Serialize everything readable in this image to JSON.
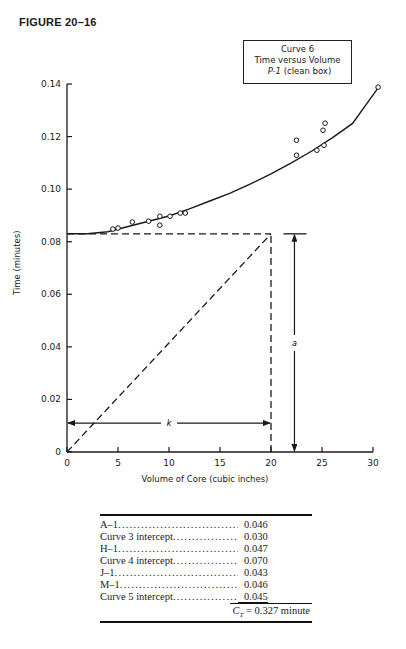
{
  "figure_label": "FIGURE 20–16",
  "legend": {
    "line1": "Curve 6",
    "line2": "Time versus Volume",
    "line3_italic": "P-1",
    "line3_rest": " (clean box)"
  },
  "annotations": {
    "k_label": "k",
    "a_label": "a"
  },
  "chart_data": {
    "type": "scatter",
    "xlabel": "Volume of Core (cubic inches)",
    "ylabel": "Time (minutes)",
    "xlim": [
      0,
      30
    ],
    "ylim": [
      0,
      0.14
    ],
    "xticks": [
      "0",
      "5",
      "10",
      "15",
      "20",
      "25",
      "30"
    ],
    "yticks": [
      "0",
      "0.02",
      "0.04",
      "0.06",
      "0.08",
      "0.10",
      "0.12",
      "0.14"
    ],
    "grid": false,
    "series": [
      {
        "name": "Observed points",
        "marker": "open-circle",
        "points": [
          [
            4.5,
            0.0848
          ],
          [
            5.0,
            0.0852
          ],
          [
            6.4,
            0.0875
          ],
          [
            8.0,
            0.0878
          ],
          [
            9.1,
            0.0897
          ],
          [
            9.1,
            0.0863
          ],
          [
            10.1,
            0.0897
          ],
          [
            11.1,
            0.0909
          ],
          [
            11.6,
            0.0909
          ],
          [
            22.5,
            0.1186
          ],
          [
            22.5,
            0.1129
          ],
          [
            24.5,
            0.1148
          ],
          [
            25.2,
            0.1167
          ],
          [
            25.1,
            0.1224
          ],
          [
            25.3,
            0.1251
          ],
          [
            30.5,
            0.1388
          ]
        ]
      },
      {
        "name": "Fitted curve",
        "style": "solid-line",
        "points": [
          [
            0,
            0.083
          ],
          [
            2,
            0.083
          ],
          [
            4,
            0.0838
          ],
          [
            6,
            0.0858
          ],
          [
            8,
            0.0878
          ],
          [
            10,
            0.0898
          ],
          [
            12,
            0.0925
          ],
          [
            14,
            0.0955
          ],
          [
            16,
            0.0985
          ],
          [
            18,
            0.102
          ],
          [
            20,
            0.1058
          ],
          [
            22,
            0.11
          ],
          [
            24,
            0.1145
          ],
          [
            26,
            0.1195
          ],
          [
            28,
            0.125
          ],
          [
            30.5,
            0.1385
          ]
        ]
      }
    ],
    "construction_lines": {
      "intercept_horizontal_dashed": {
        "y": 0.083,
        "x_from": 0,
        "x_to": 20
      },
      "vertical_dashed": {
        "x": 20,
        "y_from": 0,
        "y_to": 0.083
      },
      "diagonal_dashed": {
        "from": [
          0,
          0
        ],
        "to": [
          20,
          0.083
        ]
      },
      "k_dimension": {
        "y": 0.011,
        "x_from": 0,
        "x_to": 20,
        "label": "k"
      },
      "a_dimension": {
        "x": 22.3,
        "y_from": 0,
        "y_to": 0.083,
        "label": "a"
      }
    }
  },
  "table": {
    "rows": [
      {
        "name": "A–1",
        "value": "0.046"
      },
      {
        "name": "Curve 3 intercept",
        "value": "0.030"
      },
      {
        "name": "H–1",
        "value": "0.047"
      },
      {
        "name": "Curve 4 intercept",
        "value": "0.070"
      },
      {
        "name": "J–1",
        "value": "0.043"
      },
      {
        "name": "M–1",
        "value": "0.046"
      },
      {
        "name": "Curve 5 intercept",
        "value": "0.045"
      }
    ],
    "total_symbol": "C",
    "total_subscript": "T",
    "total_text": " = 0.327 minute"
  }
}
